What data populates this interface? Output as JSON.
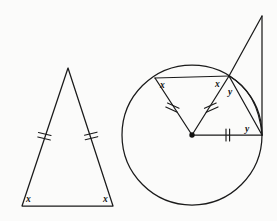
{
  "figure": {
    "background_color": "#fbfbfa",
    "stroke_color": "#1a1a1a",
    "label_color": "#111111"
  },
  "triangle": {
    "name": "isosceles-triangle",
    "apex": {
      "x": 68,
      "y": 68
    },
    "base_left": {
      "x": 22,
      "y": 206
    },
    "base_right": {
      "x": 113,
      "y": 206
    },
    "angle_labels": [
      {
        "text": "x",
        "x": 26,
        "y": 202
      },
      {
        "text": "x",
        "x": 104,
        "y": 202
      }
    ],
    "tick_marks": {
      "count_per_leg": 2,
      "legs": [
        "left-leg",
        "right-leg"
      ]
    }
  },
  "circle_figure": {
    "name": "circle-diagram",
    "circle": {
      "cx": 192,
      "cy": 135,
      "r": 70
    },
    "center_dot": {
      "cx": 192,
      "cy": 135,
      "r": 2.6
    },
    "points": {
      "center": {
        "x": 192,
        "y": 135,
        "label": "O"
      },
      "chord_left": {
        "x": 155,
        "y": 78
      },
      "chord_right": {
        "x": 229,
        "y": 76
      },
      "radius_right": {
        "x": 262,
        "y": 135
      },
      "apex_external": {
        "x": 262,
        "y": 16
      }
    },
    "angle_labels": [
      {
        "text": "x",
        "x": 160,
        "y": 88
      },
      {
        "text": "x",
        "x": 217,
        "y": 86
      },
      {
        "text": "y",
        "x": 229,
        "y": 93
      },
      {
        "text": "y",
        "x": 245,
        "y": 132
      }
    ],
    "tick_marks": {
      "radii_double": [
        "center-to-chord-left",
        "center-to-chord-right"
      ],
      "radius_single": [
        "center-to-right"
      ]
    }
  }
}
